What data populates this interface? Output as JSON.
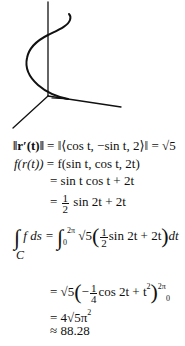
{
  "figure": {
    "axes": [
      "z-axis",
      "x-axis",
      "y-axis"
    ]
  },
  "lines": {
    "l1": {
      "lhs": "‖r′(t)‖",
      "mid": "= ‖⟨cos t, −sin t, 2⟩‖",
      "rhs": "= √5"
    },
    "l2": {
      "lhs": "f(r(t))",
      "rhs": "= f(sin t, cos t, 2t)"
    },
    "l3": {
      "rhs": "= sin t cos t + 2t"
    },
    "l4": {
      "eq": "=",
      "num": "1",
      "den": "2",
      "rest": "sin 2t + 2t"
    },
    "l5": {
      "int_label": "C",
      "lhs": "f ds =",
      "lower": "0",
      "upper": "2π",
      "coef": "√5",
      "num": "1",
      "den": "2",
      "rest": "sin 2t + 2t",
      "dt": "dt"
    },
    "l6": {
      "eq": "= √5",
      "minus": "−",
      "num": "1",
      "den": "4",
      "rest": "cos 2t + t",
      "exp": "2",
      "upper": "2π",
      "lower": "0"
    },
    "l7": {
      "text": "= 4√5π",
      "exp": "2"
    },
    "l8": {
      "text": "≈ 88.28"
    }
  },
  "colors": {
    "ink": "#111111",
    "background": "#ffffff"
  }
}
